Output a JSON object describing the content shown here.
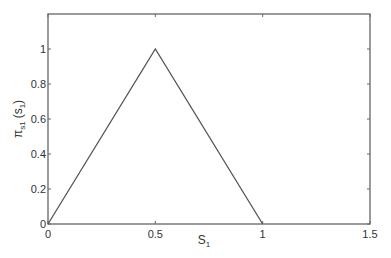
{
  "chart_data": {
    "type": "line",
    "title": "",
    "xlabel": "S1",
    "xlabel_main": "S",
    "xlabel_sub": "1",
    "ylabel": "πs1 (s1)",
    "ylabel_main": "π",
    "ylabel_sub": "s1",
    "ylabel_arg": "(s",
    "ylabel_arg_sub": "1",
    "ylabel_close": ")",
    "xlim": [
      0,
      1.5
    ],
    "ylim": [
      0,
      1.2
    ],
    "xticks": [
      0,
      0.5,
      1,
      1.5
    ],
    "xtick_labels": [
      "0",
      "0.5",
      "1",
      "1.5"
    ],
    "yticks": [
      0,
      0.2,
      0.4,
      0.6,
      0.8,
      1
    ],
    "ytick_labels": [
      "0",
      "0.2",
      "0.4",
      "0.6",
      "0.8",
      "1"
    ],
    "grid": false,
    "legend": null,
    "series": [
      {
        "name": "membership",
        "x": [
          0,
          0.5,
          1
        ],
        "y": [
          0,
          1,
          0
        ],
        "color": "#555555"
      }
    ]
  }
}
